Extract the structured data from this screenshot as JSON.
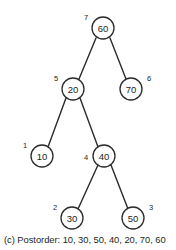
{
  "figure": {
    "caption": "(c) Postorder: 10, 30, 50, 40, 20, 70, 60",
    "caption_label": "(c)",
    "traversal_name": "Postorder",
    "traversal_sequence": [
      10,
      30,
      50,
      40,
      20,
      70,
      60
    ],
    "colors": {
      "background": "#ffffff",
      "stroke": "#2c2a2b",
      "text": "#231f20",
      "node_fill": "#ffffff"
    }
  },
  "tree": {
    "node_radius": 11,
    "nodes": [
      {
        "id": "n60",
        "value": "60",
        "order": "7",
        "cx": 103,
        "cy": 28,
        "order_x": 86,
        "order_y": 17
      },
      {
        "id": "n20",
        "value": "20",
        "order": "5",
        "cx": 73,
        "cy": 89,
        "order_x": 56,
        "order_y": 78
      },
      {
        "id": "n70",
        "value": "70",
        "order": "6",
        "cx": 131,
        "cy": 89,
        "order_x": 149,
        "order_y": 78
      },
      {
        "id": "n10",
        "value": "10",
        "order": "1",
        "cx": 42,
        "cy": 156,
        "order_x": 25,
        "order_y": 145
      },
      {
        "id": "n40",
        "value": "40",
        "order": "4",
        "cx": 104,
        "cy": 156,
        "order_x": 86,
        "order_y": 157
      },
      {
        "id": "n30",
        "value": "30",
        "order": "2",
        "cx": 72,
        "cy": 218,
        "order_x": 55,
        "order_y": 207
      },
      {
        "id": "n50",
        "value": "50",
        "order": "3",
        "cx": 133,
        "cy": 218,
        "order_x": 151,
        "order_y": 207
      }
    ],
    "edges": [
      {
        "id": "e60-20",
        "from": "n60",
        "to": "n20",
        "x1": 96,
        "y1": 38,
        "x2": 79,
        "y2": 79
      },
      {
        "id": "e60-70",
        "from": "n60",
        "to": "n70",
        "x1": 110,
        "y1": 38,
        "x2": 126,
        "y2": 79
      },
      {
        "id": "e20-10",
        "from": "n20",
        "to": "n10",
        "x1": 66,
        "y1": 98,
        "x2": 48,
        "y2": 147
      },
      {
        "id": "e20-40",
        "from": "n20",
        "to": "n40",
        "x1": 80,
        "y1": 98,
        "x2": 98,
        "y2": 147
      },
      {
        "id": "e40-30",
        "from": "n40",
        "to": "n30",
        "x1": 98,
        "y1": 165,
        "x2": 78,
        "y2": 209
      },
      {
        "id": "e40-50",
        "from": "n40",
        "to": "n50",
        "x1": 111,
        "y1": 165,
        "x2": 128,
        "y2": 209
      }
    ]
  }
}
